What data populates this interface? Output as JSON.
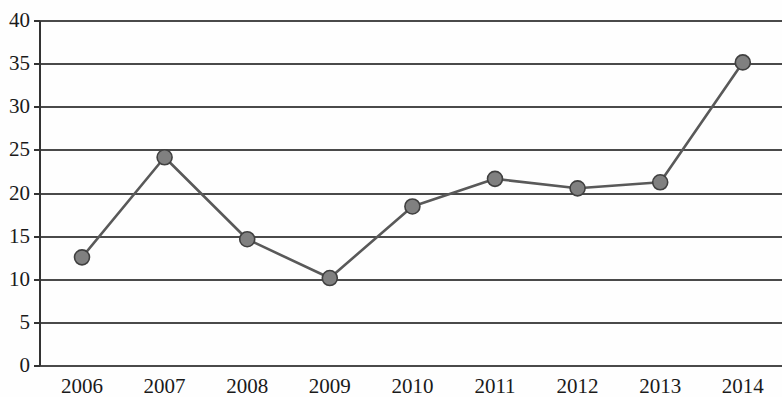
{
  "chart_data": {
    "type": "line",
    "title": "",
    "subtitle": "",
    "xlabel": "",
    "ylabel": "",
    "categories": [
      "2006",
      "2007",
      "2008",
      "2009",
      "2010",
      "2011",
      "2012",
      "2013",
      "2014"
    ],
    "values": [
      12.6,
      24.2,
      14.7,
      10.2,
      18.5,
      21.7,
      20.6,
      21.3,
      35.2
    ],
    "series": [
      {
        "name": "",
        "values": [
          12.6,
          24.2,
          14.7,
          10.2,
          18.5,
          21.7,
          20.6,
          21.3,
          35.2
        ]
      }
    ],
    "ylim": [
      0,
      40
    ],
    "yticks": [
      0,
      5,
      10,
      15,
      20,
      25,
      30,
      35,
      40
    ],
    "ytick_labels": [
      "0",
      "5",
      "10",
      "15",
      "20",
      "25",
      "30",
      "35",
      "40"
    ],
    "xtick_labels": [
      "2006",
      "2007",
      "2008",
      "2009",
      "2010",
      "2011",
      "2012",
      "2013",
      "2014"
    ],
    "grid": true,
    "grid_axis": "y",
    "legend": false,
    "legend_position": "none",
    "marker": "circle",
    "annotations": []
  },
  "style": {
    "line_color": "#595959",
    "marker_fill": "#808080",
    "marker_edge": "#404040",
    "grid_color": "#4a4a4a",
    "axis_color": "#333333",
    "background": "#fefefe",
    "tick_text_color": "#1a1a1a"
  },
  "geometry": {
    "plot_left": 40,
    "plot_right": 782,
    "plot_top": 21,
    "plot_bottom": 366,
    "first_point_x": 82,
    "x_step": 82.6,
    "marker_radius": 7.5,
    "line_width": 2.6,
    "grid_width": 2.0
  }
}
